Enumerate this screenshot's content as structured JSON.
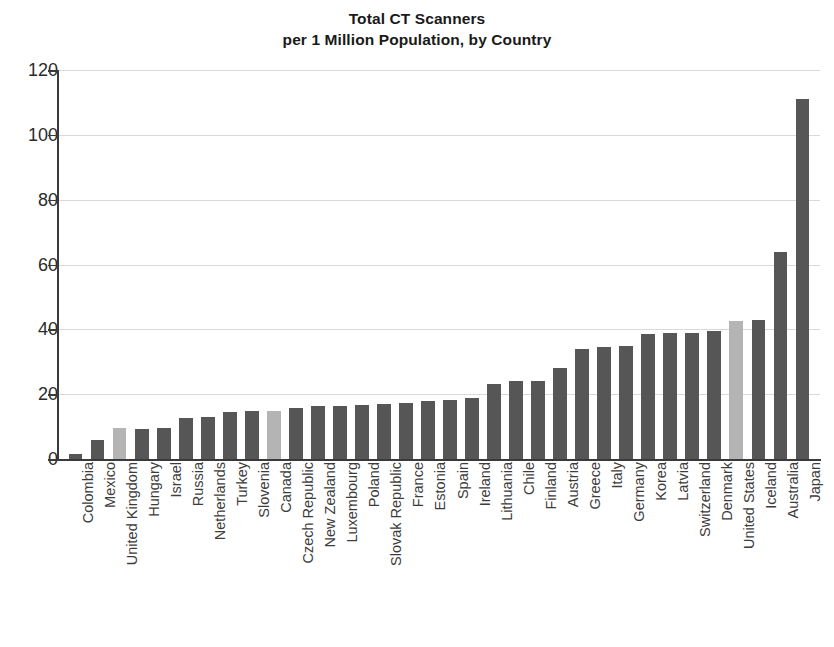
{
  "chart_data": {
    "type": "bar",
    "title": "Total CT Scanners per 1 Million Population, by Country",
    "title_lines": [
      "Total CT Scanners",
      "per 1 Million Population, by Country"
    ],
    "xlabel": "",
    "ylabel": "",
    "ylim": [
      0,
      120
    ],
    "ytick_step": 20,
    "yticks": [
      0,
      20,
      40,
      60,
      80,
      100,
      120
    ],
    "ytick_labels": [
      "0",
      "20",
      "40",
      "60",
      "80",
      "100",
      "120"
    ],
    "grid": true,
    "grid_axis": "y",
    "legend": null,
    "categories": [
      "Colombia",
      "Mexico",
      "United Kingdom",
      "Hungary",
      "Israel",
      "Russia",
      "Netherlands",
      "Turkey",
      "Slovenia",
      "Canada",
      "Czech Republic",
      "New Zealand",
      "Luxembourg",
      "Poland",
      "Slovak Republic",
      "France",
      "Estonia",
      "Spain",
      "Ireland",
      "Lithuania",
      "Chile",
      "Finland",
      "Austria",
      "Greece",
      "Italy",
      "Germany",
      "Korea",
      "Latvia",
      "Switzerland",
      "Denmark",
      "United States",
      "Iceland",
      "Australia",
      "Japan"
    ],
    "values": [
      1.5,
      6.0,
      9.5,
      9.3,
      9.5,
      12.8,
      13.1,
      14.4,
      14.7,
      14.9,
      15.6,
      16.4,
      16.4,
      16.7,
      17.1,
      17.3,
      18.0,
      18.3,
      18.7,
      23.0,
      24.0,
      24.2,
      28.2,
      34.0,
      34.5,
      34.9,
      38.6,
      38.9,
      39.0,
      39.6,
      42.6,
      43.0,
      63.9,
      111.0
    ],
    "highlighted": [
      "United Kingdom",
      "Canada",
      "United States"
    ],
    "colors": {
      "bar": "#565656",
      "bar_highlight": "#b4b4b4",
      "gridline": "#d9d9d9",
      "axis": "#3a3a3a",
      "text": "#231f20",
      "background": "#ffffff"
    }
  }
}
